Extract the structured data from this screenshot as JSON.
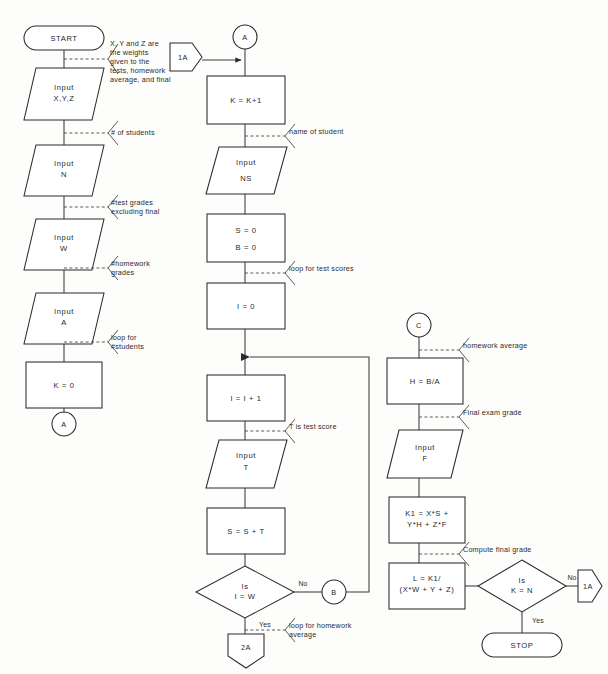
{
  "diagram": {
    "type": "flowchart",
    "background_color": "#fdfdfc",
    "stroke_color": "#2b2b2b"
  },
  "columns": {
    "left": {
      "nodes": [
        {
          "id": "start",
          "shape": "terminator",
          "label": "START"
        },
        {
          "id": "in-xyz",
          "shape": "parallelogram",
          "line1": "Input",
          "line2": "X,Y,Z"
        },
        {
          "id": "in-n",
          "shape": "parallelogram",
          "line1": "Input",
          "line2": "N"
        },
        {
          "id": "in-w",
          "shape": "parallelogram",
          "line1": "Input",
          "line2": "W"
        },
        {
          "id": "in-a",
          "shape": "parallelogram",
          "line1": "Input",
          "line2": "A"
        },
        {
          "id": "k-zero",
          "shape": "process",
          "label": "K = 0"
        },
        {
          "id": "conn-a-out",
          "shape": "circle",
          "label": "A"
        }
      ],
      "notes": [
        {
          "id": "note-xyz",
          "lines": [
            "X, Y and Z are",
            "the weights",
            "given to the",
            "tests, homework",
            "average, and final"
          ]
        },
        {
          "id": "note-n",
          "lines": [
            "# of students"
          ]
        },
        {
          "id": "note-w",
          "lines": [
            "#test grades",
            "excluding final"
          ]
        },
        {
          "id": "note-a",
          "lines": [
            "#homework",
            "grades"
          ]
        },
        {
          "id": "note-k",
          "lines": [
            "loop for",
            "#students"
          ]
        }
      ]
    },
    "middle": {
      "nodes": [
        {
          "id": "conn-a-in",
          "shape": "circle",
          "label": "A"
        },
        {
          "id": "conn-1a-top",
          "shape": "pentagon-right",
          "label": "1A"
        },
        {
          "id": "k-incr",
          "shape": "process",
          "label": "K = K+1"
        },
        {
          "id": "in-ns",
          "shape": "parallelogram",
          "line1": "Input",
          "line2": "NS"
        },
        {
          "id": "s-b-zero",
          "shape": "process",
          "line1": "S = 0",
          "line2": "B = 0"
        },
        {
          "id": "i-zero",
          "shape": "process",
          "label": "I = 0"
        },
        {
          "id": "i-incr",
          "shape": "process",
          "label": "I = I + 1"
        },
        {
          "id": "in-t",
          "shape": "parallelogram",
          "line1": "Input",
          "line2": "T"
        },
        {
          "id": "s-sum",
          "shape": "process",
          "label": "S = S + T"
        },
        {
          "id": "dec-i-w",
          "shape": "diamond",
          "line1": "Is",
          "line2": "I = W"
        },
        {
          "id": "conn-b",
          "shape": "circle",
          "label": "B"
        },
        {
          "id": "conn-2a",
          "shape": "pentagon-down",
          "label": "2A"
        }
      ],
      "notes": [
        {
          "id": "note-ns",
          "lines": [
            "name of student"
          ]
        },
        {
          "id": "note-loop-test",
          "lines": [
            "loop for test scores"
          ]
        },
        {
          "id": "note-t",
          "lines": [
            "T is test score"
          ]
        },
        {
          "id": "note-loop-hw",
          "lines": [
            "loop for homework",
            "average"
          ]
        }
      ],
      "edge_labels": [
        {
          "id": "edge-no-i-w",
          "label": "No"
        },
        {
          "id": "edge-yes-i-w",
          "label": "Yes"
        }
      ]
    },
    "right": {
      "nodes": [
        {
          "id": "conn-c",
          "shape": "circle",
          "label": "C"
        },
        {
          "id": "h-avg",
          "shape": "process",
          "label": "H = B/A"
        },
        {
          "id": "in-f",
          "shape": "parallelogram",
          "line1": "Input",
          "line2": "F"
        },
        {
          "id": "k1-calc",
          "shape": "process",
          "line1": "K1 = X*S +",
          "line2": "Y*H + Z*F"
        },
        {
          "id": "l-calc",
          "shape": "process",
          "line1": "L = K1/",
          "line2": "(X*W + Y + Z)"
        },
        {
          "id": "dec-k-n",
          "shape": "diamond",
          "line1": "Is",
          "line2": "K = N"
        },
        {
          "id": "conn-1a-bottom",
          "shape": "pentagon-right",
          "label": "1A"
        },
        {
          "id": "stop",
          "shape": "terminator",
          "label": "STOP"
        }
      ],
      "notes": [
        {
          "id": "note-hw-avg",
          "lines": [
            "homework average"
          ]
        },
        {
          "id": "note-final",
          "lines": [
            "Final exam grade"
          ]
        },
        {
          "id": "note-compute",
          "lines": [
            "Compute final grade"
          ]
        }
      ],
      "edge_labels": [
        {
          "id": "edge-no-k-n",
          "label": "No"
        },
        {
          "id": "edge-yes-k-n",
          "label": "Yes"
        }
      ]
    }
  }
}
